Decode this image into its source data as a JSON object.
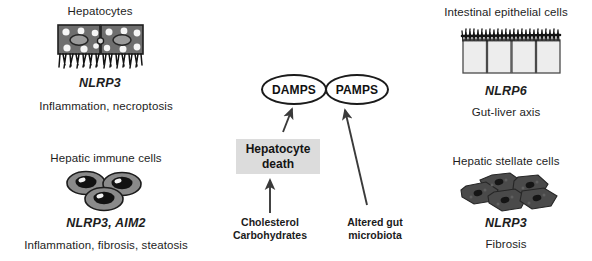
{
  "figure": {
    "background": "#ffffff",
    "ink": "#1d1d1d",
    "box_fill": "#dcdcdc",
    "cell_dark": "#585858",
    "cell_mid": "#8c8c8c",
    "cell_light": "#e9e9e9"
  },
  "panels": {
    "hepatocytes": {
      "title": "Hepatocytes",
      "gene": "NLRP3",
      "effect": "Inflammation, necroptosis",
      "icon": "hepatocyte-sheet-icon"
    },
    "hepatic_immune_cells": {
      "title": "Hepatic immune cells",
      "gene": "NLRP3, AIM2",
      "effect": "Inflammation, fibrosis, steatosis",
      "icon": "immune-cell-cluster-icon"
    },
    "intestinal_epithelial_cells": {
      "title": "Intestinal epithelial cells",
      "gene": "NLRP6",
      "effect": "Gut-liver axis",
      "icon": "intestinal-epithelium-icon"
    },
    "hepatic_stellate_cells": {
      "title": "Hepatic stellate cells",
      "gene": "NLRP3",
      "effect": "Fibrosis",
      "icon": "stellate-cell-cluster-icon"
    }
  },
  "center": {
    "damps": "DAMPS",
    "pamps": "PAMPS",
    "hepatocyte_death": {
      "line1": "Hepatocyte",
      "line2": "death"
    },
    "cholesterol_source": {
      "line1": "Cholesterol",
      "line2": "Carbohydrates"
    },
    "microbiota_source": {
      "line1": "Altered gut",
      "line2": "microbiota"
    },
    "arrows": [
      {
        "name": "arrow-death-to-damps"
      },
      {
        "name": "arrow-microbiota-to-pamps"
      },
      {
        "name": "arrow-cholesterol-to-death"
      }
    ]
  }
}
